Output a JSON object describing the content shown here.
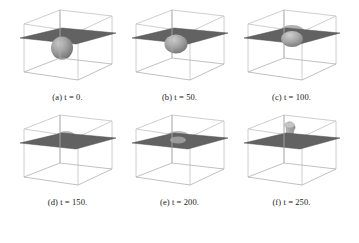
{
  "figure": {
    "type": "simulation-snapshot-grid",
    "rows": 2,
    "cols": 3,
    "colors": {
      "background": "#ffffff",
      "wireframe": "#b9b9b9",
      "wireframe_front": "#a0a0a0",
      "interface_plane": "#626262",
      "interface_plane_edge": "#4a4a4a",
      "blob_light": "#b4b4b4",
      "blob_mid": "#949494",
      "blob_dark": "#777777",
      "caption_text": "#1a1a1a"
    },
    "panels": [
      {
        "id": "panel-a",
        "letter": "(a)",
        "variable": "t",
        "equals": "=",
        "value": "0",
        "period": ".",
        "caption": "(a) t = 0.",
        "state": "spherical droplet fully below interface plane"
      },
      {
        "id": "panel-b",
        "letter": "(b)",
        "variable": "t",
        "equals": "=",
        "value": "50",
        "period": ".",
        "caption": "(b) t = 50.",
        "state": "droplet risen, contacting interface plane, slightly flattened"
      },
      {
        "id": "panel-c",
        "letter": "(c)",
        "variable": "t",
        "equals": "=",
        "value": "100",
        "period": ".",
        "caption": "(c) t = 100.",
        "state": "droplet penetrating interface plane, deformed crown"
      },
      {
        "id": "panel-d",
        "letter": "(d)",
        "variable": "t",
        "equals": "=",
        "value": "150",
        "period": ".",
        "caption": "(d) t = 150.",
        "state": "small flattened cap emerging above interface plane"
      },
      {
        "id": "panel-e",
        "letter": "(e)",
        "variable": "t",
        "equals": "=",
        "value": "200",
        "period": ".",
        "caption": "(e) t = 200.",
        "state": "low broad mound spreading on interface plane"
      },
      {
        "id": "panel-f",
        "letter": "(f)",
        "variable": "t",
        "equals": "=",
        "value": "250",
        "period": ".",
        "caption": "(f) t = 250.",
        "state": "tall mushroom column risen above interface plane"
      }
    ]
  }
}
